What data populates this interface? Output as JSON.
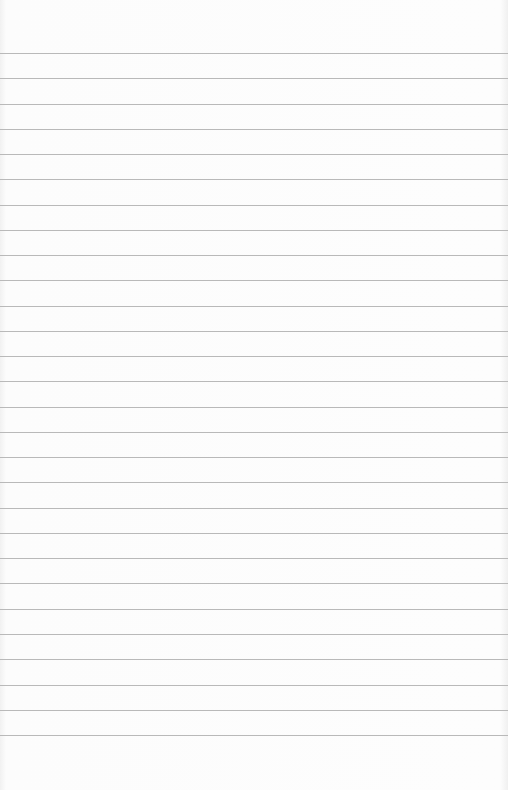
{
  "page": {
    "type": "lined-notepad-sheet",
    "rule_count": 28,
    "rule_color": "#b9b9b9",
    "paper_color": "#fbfbfb",
    "text": ""
  }
}
